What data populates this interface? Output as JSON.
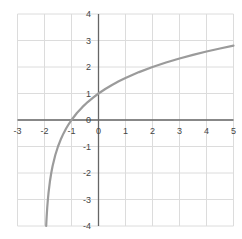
{
  "chart_data": {
    "type": "line",
    "title": "",
    "xlabel": "",
    "ylabel": "",
    "xlim": [
      -3,
      5
    ],
    "ylim": [
      -4,
      4
    ],
    "x_ticks": [
      -3,
      -2,
      -1,
      0,
      1,
      2,
      3,
      4,
      5
    ],
    "y_ticks": [
      4,
      3,
      2,
      1,
      0,
      -1,
      -2,
      -3,
      -4
    ],
    "grid": "on",
    "legend": "none",
    "series": [
      {
        "name": "curve",
        "color": "#9b9b9b",
        "points": [
          [
            -1.9375,
            -4
          ],
          [
            -1.93,
            -3.836
          ],
          [
            -1.92,
            -3.644
          ],
          [
            -1.9,
            -3.322
          ],
          [
            -1.875,
            -3
          ],
          [
            -1.85,
            -2.737
          ],
          [
            -1.8,
            -2.322
          ],
          [
            -1.75,
            -2
          ],
          [
            -1.7,
            -1.737
          ],
          [
            -1.6,
            -1.322
          ],
          [
            -1.5,
            -1
          ],
          [
            -1.4,
            -0.737
          ],
          [
            -1.3,
            -0.515
          ],
          [
            -1.2,
            -0.322
          ],
          [
            -1.1,
            -0.152
          ],
          [
            -1,
            0
          ],
          [
            -0.8,
            0.263
          ],
          [
            -0.6,
            0.485
          ],
          [
            -0.4,
            0.678
          ],
          [
            -0.2,
            0.848
          ],
          [
            0,
            1
          ],
          [
            0.25,
            1.17
          ],
          [
            0.5,
            1.322
          ],
          [
            0.75,
            1.459
          ],
          [
            1,
            1.585
          ],
          [
            1.25,
            1.7
          ],
          [
            1.5,
            1.807
          ],
          [
            2,
            2
          ],
          [
            2.5,
            2.17
          ],
          [
            3,
            2.322
          ],
          [
            3.5,
            2.459
          ],
          [
            4,
            2.585
          ],
          [
            4.5,
            2.7
          ],
          [
            5,
            2.807
          ]
        ]
      }
    ]
  },
  "colors": {
    "background": "#ffffff",
    "gridline": "#dcdcdc",
    "axis": "#666666",
    "tick_label": "#444444",
    "curve": "#9b9b9b"
  }
}
